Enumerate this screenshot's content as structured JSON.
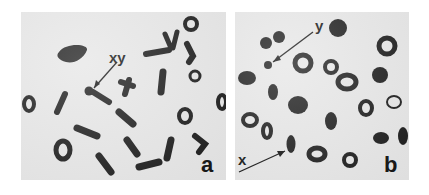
{
  "figure": {
    "panels": [
      {
        "id": "a",
        "label": "a",
        "annotations": [
          {
            "text": "xy",
            "target": "sex chromosome pair (XY bivalent)"
          }
        ]
      },
      {
        "id": "b",
        "label": "b",
        "annotations": [
          {
            "text": "y",
            "target": "Y chromosome (small univalent)"
          },
          {
            "text": "x",
            "target": "X chromosome (univalent)"
          }
        ]
      }
    ],
    "colors": {
      "background": "#e6e6e6",
      "chromosome": "#1a1a1a",
      "text": "#111111"
    }
  }
}
